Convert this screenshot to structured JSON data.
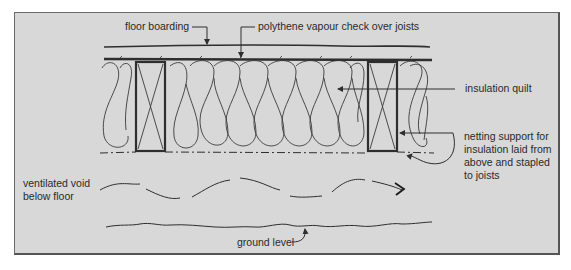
{
  "diagram": {
    "background_color": "#d8d8d8",
    "line_color": "#2e2e2e",
    "labels": {
      "floor_boarding": "floor boarding",
      "vapour_check": "polythene vapour check over joists",
      "insulation_quilt": "insulation quilt",
      "netting_support": "netting support for\ninsulation laid from\nabove and stapled\nto joists",
      "ventilated_void": "ventilated void\nbelow floor",
      "ground_level": "ground level"
    },
    "components": [
      "floor-boarding",
      "polythene-vapour-check",
      "joist-left",
      "joist-right",
      "insulation-quilt",
      "netting-support",
      "ventilation-airflow-arrow",
      "ground-line"
    ]
  }
}
